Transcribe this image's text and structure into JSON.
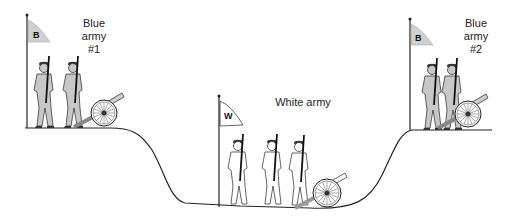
{
  "diagram": {
    "terrain": "valley between two hills",
    "armies": [
      {
        "id": "blue1",
        "label_line1": "Blue",
        "label_line2": "army",
        "label_line3": "#1",
        "flag_letter": "B",
        "position": "left hilltop",
        "soldiers": 2,
        "cannons": 1,
        "color": "#c8c8c8"
      },
      {
        "id": "white",
        "label_line1": "White army",
        "flag_letter": "W",
        "position": "valley floor",
        "soldiers": 3,
        "cannons": 1,
        "color": "#ffffff"
      },
      {
        "id": "blue2",
        "label_line1": "Blue",
        "label_line2": "army",
        "label_line3": "#2",
        "flag_letter": "B",
        "position": "right hilltop",
        "soldiers": 2,
        "cannons": 1,
        "color": "#c8c8c8"
      }
    ],
    "colors": {
      "line": "#222222",
      "blue_fill": "#c8c8c8",
      "white_fill": "#ffffff",
      "flag_blue": "#d0d0d0"
    }
  }
}
